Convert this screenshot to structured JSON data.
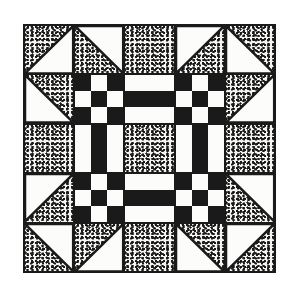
{
  "figure": {
    "colors": {
      "ink": "#1a1a1a",
      "white": "#fcfcfb",
      "speckle_base": "#f5f3f0",
      "speckle_dot": "#1a1a1a",
      "page_background": "#ffffff"
    },
    "block": {
      "grid_size": 5,
      "cells": [
        [
          "hst-white-lr",
          "hst-white-ur",
          "speckle",
          "hst-white-ul",
          "hst-white-ll"
        ],
        [
          "hst-white-ll",
          "ninepatch",
          "hrails",
          "ninepatch",
          "hst-white-lr"
        ],
        [
          "speckle",
          "vrails",
          "speckle",
          "vrails",
          "speckle"
        ],
        [
          "hst-white-ul",
          "ninepatch",
          "hrails",
          "ninepatch",
          "hst-white-ur"
        ],
        [
          "hst-white-ur",
          "hst-white-lr",
          "speckle",
          "hst-white-ll",
          "hst-white-ul"
        ]
      ],
      "ninepatch_pattern": [
        "B",
        "W",
        "B",
        "W",
        "B",
        "W",
        "B",
        "W",
        "B"
      ],
      "hrails_pattern": [
        "W",
        "B",
        "W"
      ],
      "vrails_pattern": [
        "W",
        "B",
        "W"
      ]
    }
  }
}
